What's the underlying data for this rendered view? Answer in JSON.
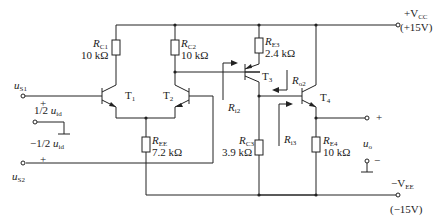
{
  "diagram": {
    "type": "circuit",
    "supplies": {
      "vcc": {
        "label": "+V",
        "sub": "CC",
        "value": "(+15V)"
      },
      "vee": {
        "label": "−V",
        "sub": "EE",
        "value": "(−15V)"
      }
    },
    "resistors": [
      {
        "id": "RC1",
        "name": "R",
        "sub": "C1",
        "value": "10 kΩ"
      },
      {
        "id": "RC2",
        "name": "R",
        "sub": "C2",
        "value": "10 kΩ"
      },
      {
        "id": "RE3",
        "name": "R",
        "sub": "E3",
        "value": "2.4 kΩ"
      },
      {
        "id": "REE",
        "name": "R",
        "sub": "EE",
        "value": "7.2 kΩ"
      },
      {
        "id": "RC3",
        "name": "R",
        "sub": "C3",
        "value": "3.9 kΩ"
      },
      {
        "id": "RE4",
        "name": "R",
        "sub": "E4",
        "value": "10 kΩ"
      }
    ],
    "transistors": [
      {
        "id": "T1",
        "label": "T",
        "sub": "1"
      },
      {
        "id": "T2",
        "label": "T",
        "sub": "2"
      },
      {
        "id": "T3",
        "label": "T",
        "sub": "3"
      },
      {
        "id": "T4",
        "label": "T",
        "sub": "4"
      }
    ],
    "inputs": {
      "us1": {
        "label": "u",
        "sub": "S1"
      },
      "us2": {
        "label": "u",
        "sub": "S2"
      },
      "half_pos": {
        "sign": "+",
        "frac": "1/2",
        "label": "u",
        "sub": "id"
      },
      "half_neg": {
        "sign": "−",
        "frac": "1/2",
        "label": "u",
        "sub": "id"
      }
    },
    "output": {
      "label": "u",
      "sub": "o",
      "plus": "+",
      "minus": "−"
    },
    "annotations": [
      {
        "label": "R",
        "sub": "i2"
      },
      {
        "label": "R",
        "sub": "o2"
      },
      {
        "label": "R",
        "sub": "i3"
      }
    ]
  }
}
